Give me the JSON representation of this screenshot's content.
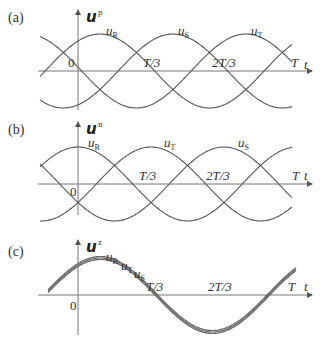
{
  "panels": [
    {
      "id": "a",
      "label": "(a)",
      "axis_symbol": "u",
      "axis_superscript": "p",
      "x_axis_label": "t",
      "ticks": [
        "0",
        "T/3",
        "2T/3",
        "T"
      ],
      "curves": [
        {
          "name": "u",
          "sub": "R"
        },
        {
          "name": "u",
          "sub": "S"
        },
        {
          "name": "u",
          "sub": "T"
        }
      ]
    },
    {
      "id": "b",
      "label": "(b)",
      "axis_symbol": "u",
      "axis_superscript": "n",
      "x_axis_label": "t",
      "ticks": [
        "0",
        "T/3",
        "2T/3",
        "T"
      ],
      "curves": [
        {
          "name": "u",
          "sub": "R"
        },
        {
          "name": "u",
          "sub": "T"
        },
        {
          "name": "u",
          "sub": "S"
        }
      ]
    },
    {
      "id": "c",
      "label": "(c)",
      "axis_symbol": "u",
      "axis_superscript": "z",
      "x_axis_label": "t",
      "ticks": [
        "0",
        "T/3",
        "2T/3",
        "T"
      ],
      "curves": [
        {
          "name": "u",
          "sub": "R"
        },
        {
          "name": "u",
          "sub": "T"
        },
        {
          "name": "u",
          "sub": "S"
        }
      ]
    }
  ],
  "chart_data": [
    {
      "type": "line",
      "title": "(a) positive sequence u^p",
      "xlabel": "t",
      "ylabel": "u^p",
      "x_ticks": [
        "0",
        "T/3",
        "2T/3",
        "T"
      ],
      "series": [
        {
          "name": "u_R",
          "phase_deg": 0
        },
        {
          "name": "u_S",
          "phase_deg": -120
        },
        {
          "name": "u_T",
          "phase_deg": 120
        }
      ]
    },
    {
      "type": "line",
      "title": "(b) negative sequence u^n",
      "xlabel": "t",
      "ylabel": "u^n",
      "x_ticks": [
        "0",
        "T/3",
        "2T/3",
        "T"
      ],
      "series": [
        {
          "name": "u_R",
          "phase_deg": 0
        },
        {
          "name": "u_T",
          "phase_deg": -120
        },
        {
          "name": "u_S",
          "phase_deg": 120
        }
      ]
    },
    {
      "type": "line",
      "title": "(c) zero sequence u^z",
      "xlabel": "t",
      "ylabel": "u^z",
      "x_ticks": [
        "0",
        "T/3",
        "2T/3",
        "T"
      ],
      "series": [
        {
          "name": "u_R",
          "phase_deg": 0
        },
        {
          "name": "u_T",
          "phase_deg": 0
        },
        {
          "name": "u_S",
          "phase_deg": 0
        }
      ]
    }
  ]
}
